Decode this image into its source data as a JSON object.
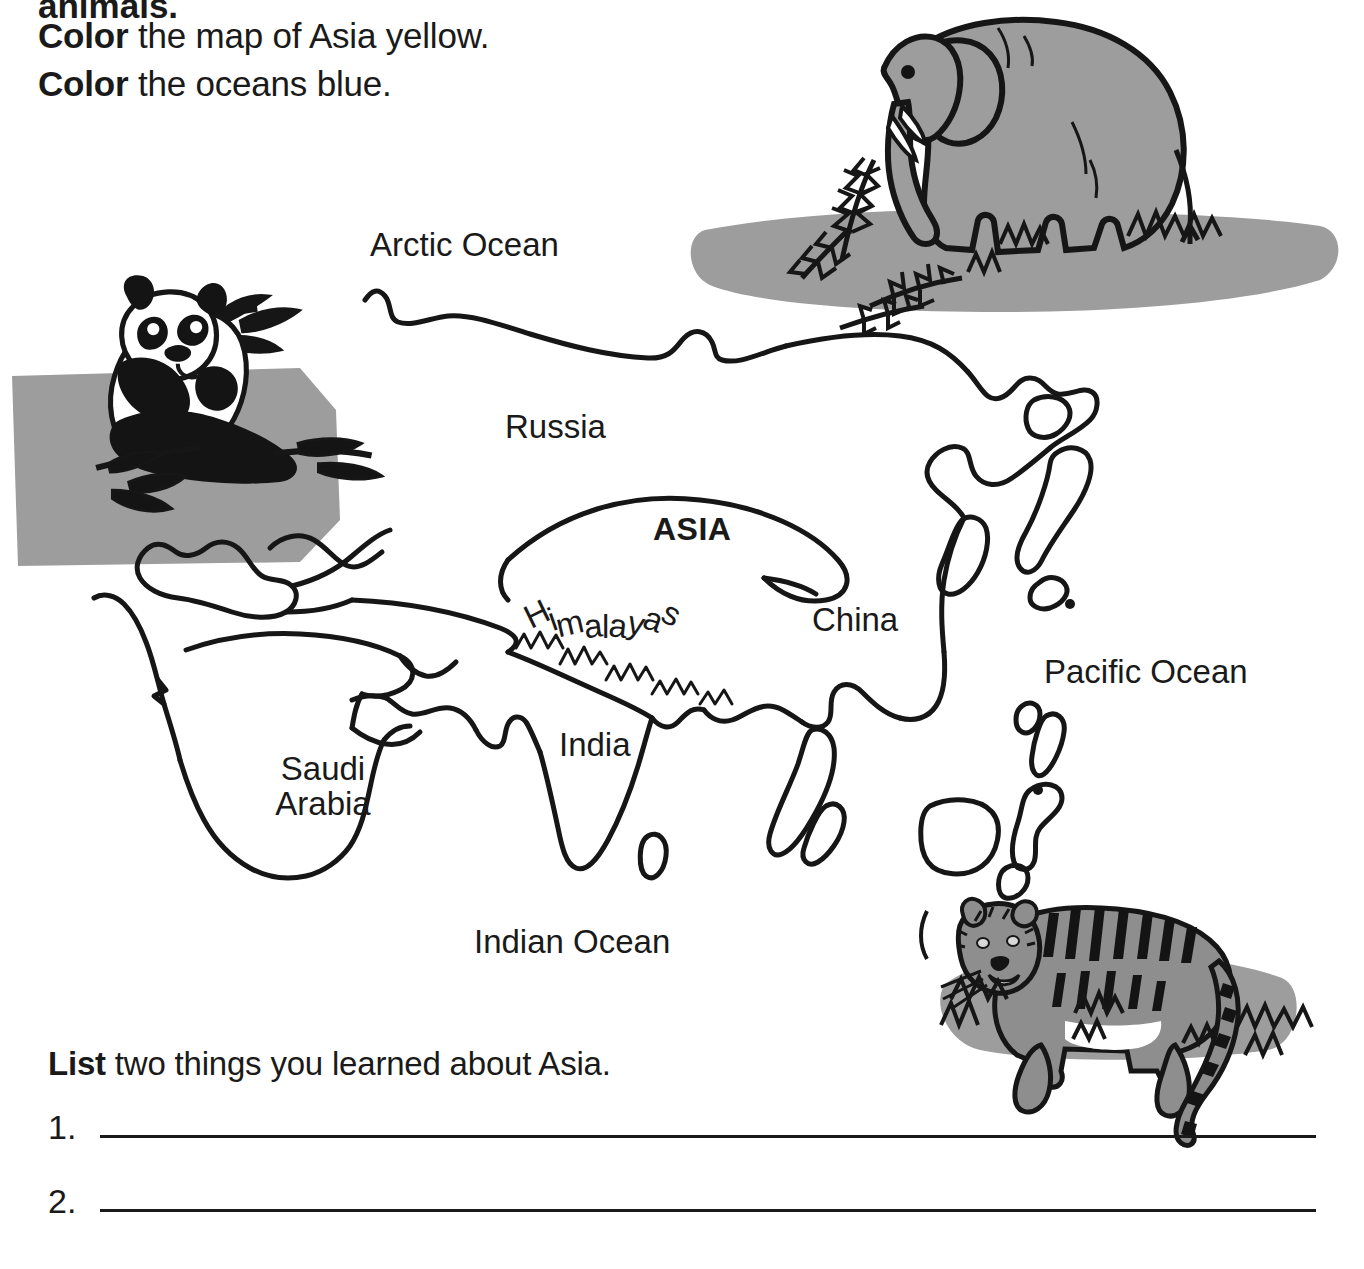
{
  "worksheet": {
    "cut_off_line": "animals.",
    "instructions": [
      {
        "bold": "Color",
        "rest": " the map of Asia yellow."
      },
      {
        "bold": "Color",
        "rest": " the oceans blue."
      }
    ],
    "list_prompt": {
      "bold": "List",
      "rest": " two things you learned about Asia."
    },
    "answer_lines": [
      {
        "number": "1."
      },
      {
        "number": "2."
      }
    ]
  },
  "map": {
    "title_label": "ASIA",
    "labels": {
      "arctic_ocean": "Arctic Ocean",
      "russia": "Russia",
      "asia": "ASIA",
      "china": "China",
      "pacific_ocean": "Pacific Ocean",
      "india": "India",
      "saudi_arabia_line1": "Saudi",
      "saudi_arabia_line2": "Arabia",
      "indian_ocean": "Indian Ocean",
      "himalayas": "Himalayas"
    },
    "himalayas_letters": [
      "H",
      "i",
      "m",
      "a",
      "l",
      "a",
      "y",
      "a",
      "s"
    ],
    "illustrations": [
      {
        "name": "panda",
        "label": "panda eating bamboo",
        "position": "northwest"
      },
      {
        "name": "elephant",
        "label": "elephant with foliage",
        "position": "northeast"
      },
      {
        "name": "tiger",
        "label": "tiger on grass",
        "position": "southeast"
      }
    ]
  },
  "colors": {
    "ink": "#161616",
    "paper": "#ffffff",
    "shade_grey": "#9d9d9d",
    "panda_black": "#141414",
    "panda_white": "#ffffff"
  }
}
